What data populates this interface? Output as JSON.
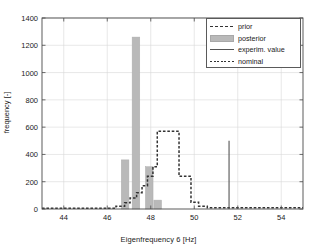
{
  "chart_data": {
    "type": "bar",
    "title": "",
    "xlabel": "Eigenfrequency 6 [Hz]",
    "ylabel": "frequency [-]",
    "xlim": [
      43,
      55
    ],
    "ylim": [
      0,
      1400
    ],
    "xticks": [
      44,
      46,
      48,
      50,
      52,
      54
    ],
    "yticks": [
      0,
      200,
      400,
      600,
      800,
      1000,
      1200,
      1400
    ],
    "grid": true,
    "legend_position": "top-right",
    "legend": [
      {
        "label": "prior",
        "style": "dashed-line",
        "color": "#333333"
      },
      {
        "label": "posterior",
        "style": "filled-patch",
        "color": "#b9b9b9"
      },
      {
        "label": "experim. value",
        "style": "solid-line",
        "color": "#555555"
      },
      {
        "label": "nominal",
        "style": "dashed-line",
        "color": "#333333"
      }
    ],
    "series": [
      {
        "name": "posterior",
        "type": "bar",
        "color": "#b9b9b9",
        "bin_width": 0.35,
        "x": [
          46.82,
          47.32,
          47.93,
          48.32
        ],
        "values": [
          360,
          1260,
          310,
          65
        ]
      },
      {
        "name": "prior",
        "type": "step",
        "color": "#333333",
        "x": [
          43.0,
          46.0,
          46.4,
          46.8,
          47.05,
          47.35,
          47.6,
          47.85,
          48.1,
          48.3,
          49.2,
          49.3,
          49.7,
          49.85,
          50.2,
          50.6,
          55.0
        ],
        "values": [
          5,
          5,
          20,
          45,
          80,
          120,
          170,
          240,
          310,
          570,
          570,
          240,
          240,
          50,
          20,
          10,
          10
        ]
      },
      {
        "name": "experim. value",
        "type": "vline",
        "color": "#555555",
        "x": 51.6,
        "value": 500
      }
    ]
  },
  "axes": {
    "xlabel": "Eigenfrequency 6 [Hz]",
    "ylabel": "frequency [-]",
    "xtick_labels": [
      "44",
      "46",
      "48",
      "50",
      "52",
      "54"
    ],
    "ytick_labels": [
      "0",
      "200",
      "400",
      "600",
      "800",
      "1000",
      "1200",
      "1400"
    ]
  },
  "legend": {
    "items": [
      {
        "label": "prior"
      },
      {
        "label": "posterior"
      },
      {
        "label": "experim. value"
      },
      {
        "label": "nominal"
      }
    ]
  }
}
